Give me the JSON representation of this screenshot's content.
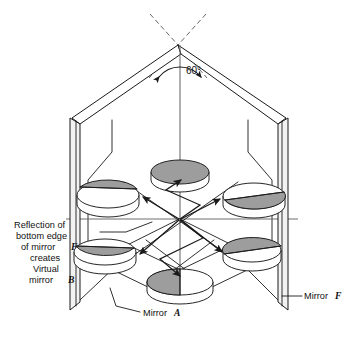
{
  "figure": {
    "background_color": "#ffffff",
    "line_color": "#1a1a1a",
    "disc_gray": "#9d9d9d",
    "disc_white": "#ffffff",
    "width": 350,
    "height": 337
  },
  "annotations": {
    "angle_label": "60°",
    "left_note_lines": [
      "Reflection of",
      "bottom edge",
      "of mirror",
      "creates",
      "Virtual",
      "mirror"
    ],
    "left_note_italic_1": "F",
    "left_note_italic_2": "B",
    "bottom_label_text": "Mirror",
    "bottom_label_italic": "A",
    "right_label_text": "Mirror",
    "right_label_italic": "F"
  },
  "geometry": {
    "apex": [
      178,
      45
    ],
    "center": [
      180,
      219
    ],
    "vertical_axis": {
      "x": 180,
      "y1": 45,
      "y2": 285
    },
    "horizontal_axis": {
      "y": 219,
      "x1": 65,
      "x2": 297
    },
    "dashes": [
      "M 150,14 L 178,45",
      "M 206,14 L 178,45",
      "M 178,45 L 205,76",
      "M 178,45 L 151,76"
    ],
    "angle_arc": "M 158,76 A 26,26 0 0 1 202,76",
    "mirror_left_slab": {
      "front": "M 72,118 L 80,124 L 80,302 L 72,310 Z",
      "spine": "M 72,118 L 72,310"
    },
    "mirror_right_slab": {
      "front": "M 286,118 L 278,124 L 278,302 L 286,310 Z",
      "spine": "M 286,118 L 286,310"
    },
    "top_left_panel": "M 178,45 L 72,118 L 80,124 L 180,53 Z",
    "top_right_panel": "M 178,45 L 286,118 L 278,124 L 180,53 Z",
    "inner_hexagon": "M 180,53 L 80,124 L 80,302 L 278,302 L 278,124 Z",
    "back_wall_outline": "M 110,120 L 110,155 L 88,178 L 88,262 L 272,262 L 272,178 L 250,155 L 250,120",
    "floor_left": "M 80,302 L 118,262 L 150,286",
    "floor_right": "M 278,302 L 240,262 L 208,286",
    "discs": [
      {
        "name": "disc-top-center",
        "cx": 180,
        "cy": 172,
        "rx": 29,
        "ry": 12,
        "depth": 8,
        "split": "vertical-full-gray",
        "gray_side": "all"
      },
      {
        "name": "disc-bottom-center",
        "cx": 180,
        "cy": 282,
        "rx": 33,
        "ry": 13,
        "depth": 9,
        "split": "vertical",
        "gray_side": "left"
      },
      {
        "name": "disc-upper-left",
        "cx": 108,
        "cy": 195,
        "rx": 31,
        "ry": 13,
        "depth": 9,
        "split": "diagonal",
        "gray_side": "upper"
      },
      {
        "name": "disc-lower-left",
        "cx": 105,
        "cy": 252,
        "rx": 31,
        "ry": 13,
        "depth": 9,
        "split": "diagonal",
        "gray_side": "lower"
      },
      {
        "name": "disc-upper-right",
        "cx": 254,
        "cy": 196,
        "rx": 31,
        "ry": 13,
        "depth": 9,
        "split": "diagonal-rev",
        "gray_side": "lower"
      },
      {
        "name": "disc-lower-right",
        "cx": 252,
        "cy": 250,
        "rx": 29,
        "ry": 12,
        "depth": 9,
        "split": "diagonal-rev",
        "gray_side": "upper"
      }
    ],
    "rays": [
      "M 180,219 L 141,196",
      "M 180,219 L 140,252",
      "M 180,219 L 222,197",
      "M 180,219 L 224,250",
      "M 180,219 L 205,240 L 160,258 L 180,282",
      "M 180,219 L 198,200 L 163,185 L 180,172"
    ],
    "ray_arrows": [
      {
        "x": 141,
        "y": 196,
        "angle": 210
      },
      {
        "x": 140,
        "y": 252,
        "angle": 140
      },
      {
        "x": 222,
        "y": 197,
        "angle": 332
      },
      {
        "x": 224,
        "y": 250,
        "angle": 38
      },
      {
        "x": 180,
        "y": 176,
        "angle": 270
      },
      {
        "x": 180,
        "y": 278,
        "angle": 90
      }
    ],
    "cross_lines": [
      "M 120,262 L 240,176",
      "M 120,176 L 240,262",
      "M 150,286 L 210,240",
      "M 210,286 L 150,240"
    ],
    "rhombus": "M 180,219 L 232,244 L 180,270 L 128,244 Z",
    "leaders": {
      "left_note": "M 96,234 L 120,234 L 150,222",
      "bottom": "M 112,290 L 118,306 L 140,312",
      "right": "M 283,295 L 300,295"
    }
  },
  "label_positions": {
    "angle": [
      186,
      71
    ],
    "left_note_x": 14,
    "left_note_y_start": 228,
    "left_note_line_height": 11,
    "bottom_label": [
      143,
      316
    ],
    "right_label": [
      303,
      298
    ]
  }
}
